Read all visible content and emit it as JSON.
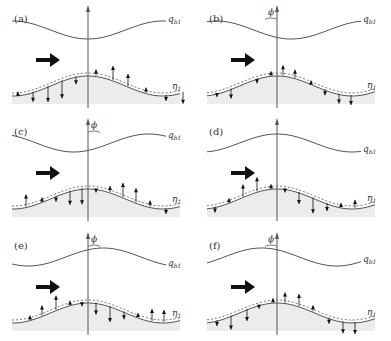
{
  "figure": {
    "panels": [
      {
        "id": "a",
        "label": "(a)",
        "ox": 0,
        "oy": 0,
        "axis_x": 88,
        "phi": false,
        "qb_phase": 0,
        "arrows": [
          [
            -70,
            -3
          ],
          [
            -55,
            10
          ],
          [
            -40,
            16
          ],
          [
            -26,
            18
          ],
          [
            -12,
            8
          ],
          [
            8,
            -6
          ],
          [
            25,
            -14
          ],
          [
            40,
            -12
          ],
          [
            58,
            -5
          ],
          [
            78,
            6
          ],
          [
            95,
            12
          ]
        ]
      },
      {
        "id": "b",
        "label": "(b)",
        "ox": 195,
        "oy": 0,
        "axis_x": 82,
        "phi": true,
        "phi_label": "ϕ",
        "qb_phase": -0.6,
        "arrows": [
          [
            -60,
            4
          ],
          [
            -46,
            10
          ],
          [
            -20,
            5
          ],
          [
            -6,
            -4
          ],
          [
            6,
            -10
          ],
          [
            18,
            -8
          ],
          [
            34,
            -3
          ],
          [
            48,
            6
          ],
          [
            62,
            10
          ],
          [
            74,
            10
          ]
        ]
      },
      {
        "id": "c",
        "label": "(c)",
        "ox": 0,
        "oy": 113,
        "axis_x": 88,
        "phi": true,
        "phi_label": "ϕ",
        "qb_phase": 0.6,
        "arrows": [
          [
            -62,
            -12
          ],
          [
            -46,
            -4
          ],
          [
            -32,
            6
          ],
          [
            -18,
            14
          ],
          [
            -6,
            16
          ],
          [
            8,
            4
          ],
          [
            22,
            -6
          ],
          [
            35,
            -14
          ],
          [
            48,
            -14
          ],
          [
            62,
            -6
          ],
          [
            78,
            6
          ]
        ]
      },
      {
        "id": "d",
        "label": "(d)",
        "ox": 195,
        "oy": 113,
        "axis_x": 82,
        "phi": false,
        "qb_phase": 3.14,
        "arrows": [
          [
            -62,
            6
          ],
          [
            -48,
            -4
          ],
          [
            -34,
            -12
          ],
          [
            -20,
            -14
          ],
          [
            -6,
            -4
          ],
          [
            8,
            4
          ],
          [
            22,
            12
          ],
          [
            36,
            16
          ],
          [
            50,
            8
          ],
          [
            64,
            -4
          ],
          [
            78,
            -8
          ]
        ]
      },
      {
        "id": "e",
        "label": "(e)",
        "ox": 0,
        "oy": 227,
        "axis_x": 88,
        "phi": true,
        "phi_label": "ϕ",
        "qb_phase": 2.5,
        "arrows": [
          [
            -58,
            -4
          ],
          [
            -46,
            -10
          ],
          [
            -32,
            -14
          ],
          [
            -18,
            -4
          ],
          [
            -6,
            4
          ],
          [
            8,
            12
          ],
          [
            22,
            16
          ],
          [
            36,
            8
          ],
          [
            50,
            -4
          ],
          [
            64,
            -12
          ],
          [
            76,
            -12
          ]
        ]
      },
      {
        "id": "f",
        "label": "(f)",
        "ox": 195,
        "oy": 227,
        "axis_x": 82,
        "phi": true,
        "phi_label": "ϕ",
        "qb_phase": -2.5,
        "arrows": [
          [
            -60,
            6
          ],
          [
            -46,
            14
          ],
          [
            -30,
            12
          ],
          [
            -18,
            4
          ],
          [
            -4,
            -4
          ],
          [
            8,
            -10
          ],
          [
            22,
            -12
          ],
          [
            36,
            -6
          ],
          [
            52,
            6
          ],
          [
            66,
            12
          ],
          [
            78,
            12
          ]
        ]
      }
    ],
    "curve_labels": {
      "qb": "q",
      "qb_sub": "b1",
      "eta": "η",
      "eta_sub": "1"
    },
    "colors": {
      "line": "#555555",
      "fill": "#ececec",
      "arrow": "#111111",
      "flow_arrow": "#111111"
    }
  }
}
